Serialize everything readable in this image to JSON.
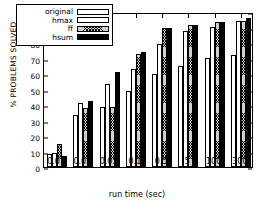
{
  "chart_data": {
    "type": "bar",
    "title": "",
    "xlabel": "run time (sec)",
    "ylabel": "% PROBLEMS SOLVED",
    "categories": [
      "0.01",
      "0.03",
      "0.05",
      "0.1",
      "0.5",
      "5",
      "100",
      "300"
    ],
    "series": [
      {
        "name": "original",
        "fill": "white",
        "values": [
          8.5,
          33.5,
          39.0,
          49.0,
          60.0,
          65.0,
          70.5,
          72.5
        ]
      },
      {
        "name": "hmax",
        "fill": "dotted",
        "values": [
          9.0,
          41.5,
          53.5,
          63.5,
          79.5,
          88.0,
          90.5,
          94.0
        ]
      },
      {
        "name": "ff",
        "fill": "crosshatch",
        "values": [
          15.0,
          38.0,
          38.5,
          73.0,
          89.5,
          91.5,
          93.5,
          94.5
        ]
      },
      {
        "name": "hsum",
        "fill": "solid-black",
        "values": [
          7.0,
          42.5,
          61.0,
          74.5,
          90.0,
          91.5,
          93.5,
          96.0
        ]
      }
    ],
    "ylim": [
      0,
      100
    ],
    "yticks": [
      0,
      10,
      20,
      30,
      40,
      50,
      60,
      70,
      80,
      90,
      100
    ],
    "ytick_labels": [
      "0",
      "10",
      "20",
      "30",
      "40",
      "50",
      "60",
      "70",
      "80",
      "90",
      "100"
    ],
    "grid": false,
    "legend_position": "top-left",
    "legend_entries": [
      "original",
      "hmax",
      "ff",
      "hsum"
    ]
  }
}
